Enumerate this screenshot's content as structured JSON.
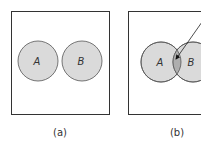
{
  "colors": {
    "frame_stroke": "#333333",
    "circle_fill": "#dadada",
    "circle_stroke": "#555555",
    "intersection_fill": "#aeaeae",
    "text": "#333333"
  },
  "panels": [
    {
      "caption": "(a)",
      "circles": [
        {
          "label": "A"
        },
        {
          "label": "B"
        }
      ],
      "relation": "disjoint"
    },
    {
      "caption": "(b)",
      "circles": [
        {
          "label": "A"
        },
        {
          "label": "B"
        }
      ],
      "relation": "overlapping",
      "annotation": "arrow-pointing-to-intersection"
    }
  ]
}
